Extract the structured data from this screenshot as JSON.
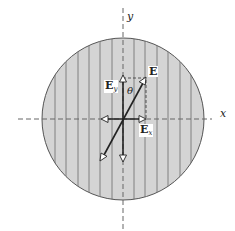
{
  "diagram": {
    "axes": {
      "x_label": "x",
      "y_label": "y"
    },
    "vectors": {
      "E": {
        "label": "E"
      },
      "Ey": {
        "label": "E",
        "subscript": "y"
      },
      "Ex": {
        "label": "E",
        "subscript": "x"
      }
    },
    "angle_label": "θ",
    "colors": {
      "disk_fill": "#d4d4d4",
      "disk_stroke": "#555555",
      "stripe": "#6a6a6a",
      "vector": "#222222",
      "axis_dash": "#666666"
    }
  }
}
